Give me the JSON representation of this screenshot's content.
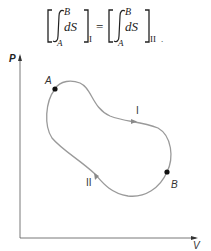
{
  "equation": {
    "integral_upper": "B",
    "integral_lower": "A",
    "integrand": "dS",
    "left_path_subscript": "I",
    "right_path_subscript": "II",
    "equals": "=",
    "trailing_punct": "."
  },
  "diagram": {
    "y_axis_label": "P",
    "x_axis_label": "V",
    "point_a_label": "A",
    "point_b_label": "B",
    "path_1_label": "I",
    "path_2_label": "II",
    "curve_color": "#9a9a9a",
    "axis_color": "#555555",
    "point_color": "#111111"
  }
}
